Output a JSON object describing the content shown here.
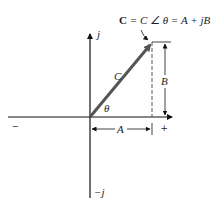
{
  "diagram": {
    "title_equation": {
      "bold_symbol": "C",
      "rest": " = C ∠ θ = A + jB"
    },
    "axis_labels": {
      "positive_imag": "j",
      "negative_imag": "−j",
      "positive_real": "+",
      "negative_real": "−"
    },
    "vector_label": "C",
    "angle_label": "θ",
    "real_component_label": "A",
    "imag_component_label": "B",
    "colors": {
      "vector": "#555555",
      "axes": "#111111",
      "text": "#222222"
    }
  }
}
